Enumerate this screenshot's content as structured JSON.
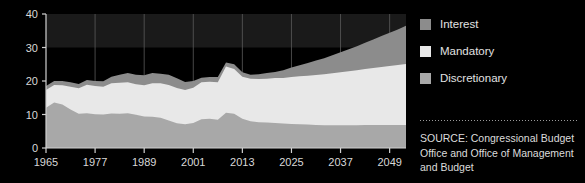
{
  "chart_data": {
    "type": "area",
    "stacked": true,
    "title": "",
    "subtitle": "",
    "xlabel": "",
    "ylabel": "",
    "xlim": [
      1965,
      2053
    ],
    "ylim": [
      0,
      40
    ],
    "yticks": [
      0,
      10,
      20,
      30,
      40
    ],
    "xticks": [
      1965,
      1977,
      1989,
      2001,
      2013,
      2025,
      2037,
      2049
    ],
    "grid": true,
    "grid_axis": "x",
    "legend_position": "right",
    "x": [
      1965,
      1967,
      1969,
      1971,
      1973,
      1975,
      1977,
      1979,
      1981,
      1983,
      1985,
      1987,
      1989,
      1991,
      1993,
      1995,
      1997,
      1999,
      2001,
      2003,
      2005,
      2007,
      2009,
      2011,
      2013,
      2015,
      2017,
      2019,
      2021,
      2023,
      2025,
      2027,
      2029,
      2031,
      2033,
      2035,
      2037,
      2039,
      2041,
      2043,
      2045,
      2047,
      2049,
      2051,
      2053
    ],
    "series": [
      {
        "name": "Discretionary",
        "color": "#a8a8a8",
        "values": [
          12.0,
          13.6,
          13.0,
          11.5,
          10.2,
          10.4,
          10.1,
          10.0,
          10.3,
          10.2,
          10.4,
          9.9,
          9.4,
          9.3,
          9.0,
          8.2,
          7.4,
          7.1,
          7.5,
          8.6,
          8.7,
          8.4,
          10.5,
          10.2,
          8.7,
          8.0,
          7.7,
          7.6,
          7.5,
          7.3,
          7.2,
          7.1,
          7.0,
          6.9,
          6.8,
          6.8,
          6.8,
          6.8,
          6.8,
          6.9,
          6.9,
          6.9,
          6.9,
          6.9,
          6.9
        ]
      },
      {
        "name": "Mandatory",
        "color": "#e8e8e8",
        "values": [
          5.3,
          5.2,
          5.7,
          6.8,
          7.6,
          8.5,
          8.4,
          8.3,
          9.0,
          9.3,
          9.2,
          9.1,
          9.3,
          10.0,
          10.3,
          10.6,
          10.5,
          10.2,
          10.5,
          11.0,
          11.1,
          11.2,
          13.8,
          13.4,
          12.6,
          12.7,
          12.9,
          13.1,
          13.4,
          13.6,
          14.0,
          14.3,
          14.6,
          14.9,
          15.2,
          15.5,
          15.8,
          16.1,
          16.4,
          16.7,
          17.0,
          17.3,
          17.6,
          17.9,
          18.2
        ]
      },
      {
        "name": "Interest",
        "color": "#8c8c8c",
        "values": [
          1.2,
          1.2,
          1.3,
          1.3,
          1.3,
          1.4,
          1.5,
          1.6,
          2.0,
          2.4,
          2.8,
          2.9,
          3.0,
          3.1,
          2.9,
          3.1,
          2.9,
          2.4,
          2.0,
          1.4,
          1.4,
          1.6,
          1.2,
          1.4,
          1.3,
          1.2,
          1.4,
          1.7,
          1.8,
          2.3,
          2.8,
          3.3,
          3.8,
          4.3,
          4.8,
          5.4,
          6.0,
          6.6,
          7.2,
          7.8,
          8.5,
          9.2,
          9.9,
          10.6,
          11.4
        ]
      }
    ]
  },
  "legend": {
    "items": [
      {
        "label": "Interest",
        "color": "#8c8c8c"
      },
      {
        "label": "Mandatory",
        "color": "#e8e8e8"
      },
      {
        "label": "Discretionary",
        "color": "#a8a8a8"
      }
    ]
  },
  "source": {
    "text": "SOURCE: Congressional Budget Office and Office of Management and Budget"
  },
  "colors": {
    "background": "#000000",
    "axis": "#d0d0d0",
    "tick_label": "#d8d8d8",
    "gridline": "#5a5a5a",
    "upper_band": "#1a1a1a"
  }
}
